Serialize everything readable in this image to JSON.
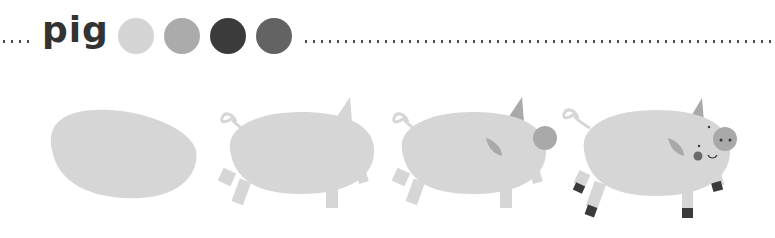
{
  "title": "pig",
  "palette": {
    "colors": [
      "#d4d4d4",
      "#ababab",
      "#3b3b3b",
      "#636363"
    ],
    "labels": [
      "light-gray",
      "medium-gray",
      "dark-gray",
      "charcoal-gray"
    ]
  },
  "steps": [
    {
      "stage": 1,
      "label": "body-blob"
    },
    {
      "stage": 2,
      "label": "body-with-tail-ear-legs"
    },
    {
      "stage": 3,
      "label": "add-ear-and-snout"
    },
    {
      "stage": 4,
      "label": "finished-pig-with-face-and-hooves"
    }
  ],
  "colors": {
    "body": "#d6d6d6",
    "detail": "#a9a9a9",
    "dark": "#3a3a3a",
    "dots": "#444444"
  }
}
